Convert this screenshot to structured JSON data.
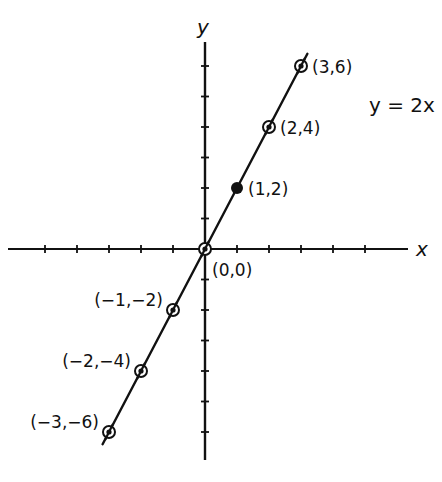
{
  "chart_data": {
    "type": "line",
    "title": "",
    "equation_label": "y = 2x",
    "xlabel": "x",
    "ylabel": "y",
    "xlim": [
      -6,
      6
    ],
    "ylim": [
      -7,
      7
    ],
    "x_ticks": [
      -5,
      -4,
      -3,
      -2,
      -1,
      1,
      2,
      3,
      4,
      5
    ],
    "y_ticks": [
      -6,
      -5,
      -4,
      -3,
      -2,
      -1,
      1,
      2,
      3,
      4,
      5,
      6
    ],
    "tick_labels_shown": false,
    "grid": false,
    "legend": null,
    "series": [
      {
        "name": "y = 2x",
        "x": [
          -3,
          -2,
          -1,
          0,
          1,
          2,
          3
        ],
        "y": [
          -6,
          -4,
          -2,
          0,
          2,
          4,
          6
        ]
      }
    ],
    "points": [
      {
        "x": 3,
        "y": 6,
        "label": "(3,6)",
        "marker": "ring",
        "label_side": "right"
      },
      {
        "x": 2,
        "y": 4,
        "label": "(2,4)",
        "marker": "ring",
        "label_side": "right"
      },
      {
        "x": 1,
        "y": 2,
        "label": "(1,2)",
        "marker": "filled",
        "label_side": "right"
      },
      {
        "x": 0,
        "y": 0,
        "label": "(0,0)",
        "marker": "ring",
        "label_side": "below-right"
      },
      {
        "x": -1,
        "y": -2,
        "label": "(−1,−2)",
        "marker": "ring",
        "label_side": "left"
      },
      {
        "x": -2,
        "y": -4,
        "label": "(−2,−4)",
        "marker": "ring",
        "label_side": "left"
      },
      {
        "x": -3,
        "y": -6,
        "label": "(−3,−6)",
        "marker": "ring",
        "label_side": "left"
      }
    ],
    "line_extent_x": [
      -3.2,
      3.2
    ]
  },
  "colors": {
    "ink": "#111111",
    "background": "#ffffff"
  }
}
